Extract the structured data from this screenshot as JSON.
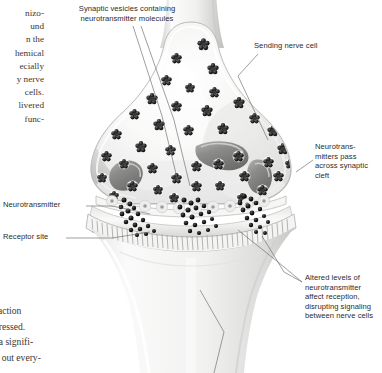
{
  "figure": {
    "style": "grayscale-airbrush-medical-illustration",
    "colors": {
      "page_background": "#ffffff",
      "cell_light": "#f4f4f3",
      "cell_mid": "#dededd",
      "cell_shadow": "#b9b9b8",
      "vesicle_dark": "#1d1d1d",
      "mitochondrion": "#8f8f8f",
      "label_text": "#2b2b2b",
      "body_text": "#3b3733",
      "leader_line": "#6b6b6b"
    }
  },
  "labels": {
    "vesicles": "Synaptic vesicles containing\nneurotransmitter molecules",
    "sending_cell": "Sending nerve cell",
    "transmitters_pass": "Neurotrans-\nmitters pass\nacross synaptic\ncleft",
    "neurotransmitter": "Neurotransmitter",
    "receptor_site": "Receptor site",
    "altered_levels": "Altered levels of\nneurotransmitter\naffect reception,\ndisrupting signaling\nbetween nerve cells"
  },
  "body_text": {
    "top_column_lines": [
      "nizo-",
      "und",
      "n the",
      "hemical",
      "ecially",
      "y nerve",
      "cells.",
      "livered",
      "func-"
    ],
    "bottom_column_lines": [
      "their responses.",
      "w from all interaction",
      "ome deeply depressed.",
      "zophrenia have a signifi-",
      "  ability to carry out every-"
    ]
  }
}
